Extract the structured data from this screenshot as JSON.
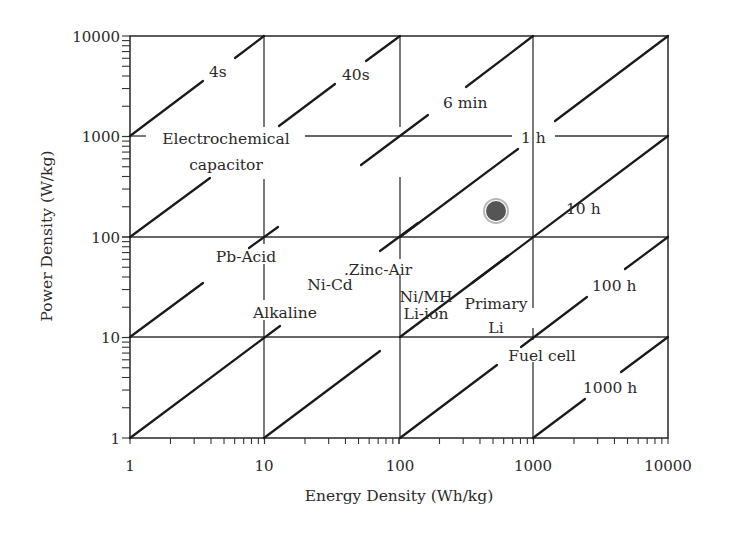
{
  "chart_data": {
    "type": "line",
    "title": "",
    "xlabel": "Energy Density (Wh/kg)",
    "ylabel": "Power Density (W/kg)",
    "xscale": "log",
    "yscale": "log",
    "xlim": [
      1,
      10000
    ],
    "ylim": [
      1,
      10000
    ],
    "grid": true,
    "legend": "none",
    "x_ticks": [
      "1",
      "10",
      "100",
      "1000",
      "10000"
    ],
    "y_ticks": [
      "1",
      "10",
      "100",
      "1000",
      "10000"
    ],
    "time_constant_lines": [
      {
        "label": "4s",
        "hours": 0.001111,
        "note": "P = E/t"
      },
      {
        "label": "40s",
        "hours": 0.01111
      },
      {
        "label": "6 min",
        "hours": 0.1
      },
      {
        "label": "1 h",
        "hours": 1
      },
      {
        "label": "10 h",
        "hours": 10
      },
      {
        "label": "100 h",
        "hours": 100
      },
      {
        "label": "1000 h",
        "hours": 1000
      }
    ],
    "region_labels": [
      {
        "label": "Electrochemical capacitor",
        "energy": 5,
        "power": 800
      },
      {
        "label": "Pb-Acid",
        "energy": 8,
        "power": 65
      },
      {
        "label": "Ni-Cd",
        "energy": 35,
        "power": 40
      },
      {
        "label": "Zinc-Air",
        "energy": 100,
        "power": 50
      },
      {
        "label": "Ni/MH",
        "energy": 100,
        "power": 28
      },
      {
        "label": "Li-ion",
        "energy": 100,
        "power": 17
      },
      {
        "label": "Alkaline",
        "energy": 12,
        "power": 17
      },
      {
        "label": "Primary Li",
        "energy": 450,
        "power": 20
      },
      {
        "label": "Fuel cell",
        "energy": 800,
        "power": 7
      }
    ],
    "points": [
      {
        "name": "marker-dot",
        "energy": 550,
        "power": 180
      }
    ]
  },
  "axes": {
    "x_title": "Energy Density (Wh/kg)",
    "y_title": "Power Density (W/kg)",
    "x_ticks": [
      "1",
      "10",
      "100",
      "1000",
      "10000"
    ],
    "y_ticks": [
      "1",
      "10",
      "100",
      "1000",
      "10000"
    ]
  },
  "labels": {
    "t_4s": "4s",
    "t_40s": "40s",
    "t_6min": "6 min",
    "t_1h": "1 h",
    "t_10h": "10 h",
    "t_100h": "100 h",
    "t_1000h": "1000 h",
    "electrochemical": "Electrochemical",
    "capacitor": "capacitor",
    "pb_acid": "Pb-Acid",
    "ni_cd": "Ni-Cd",
    "zinc_air": ".Zinc-Air",
    "ni_mh": "Ni/MH",
    "li_ion": "Li-ion",
    "alkaline": "Alkaline",
    "primary": "Primary",
    "li": "Li",
    "fuel_cell": "Fuel cell"
  },
  "colors": {
    "line": "#1a1a1a",
    "grid": "#2a2a2a",
    "dot": "#555555"
  }
}
